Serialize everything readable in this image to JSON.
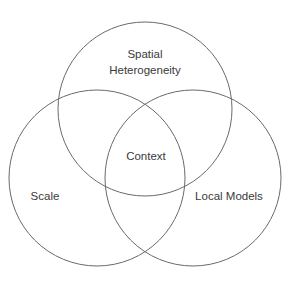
{
  "diagram": {
    "type": "venn",
    "stroke_color": "#6a6a6a",
    "text_color": "#3a3a3a",
    "sets": [
      {
        "id": "spatial-heterogeneity",
        "label_lines": [
          "Spatial",
          "Heterogeneity"
        ]
      },
      {
        "id": "scale",
        "label_lines": [
          "Scale"
        ]
      },
      {
        "id": "local-models",
        "label_lines": [
          "Local Models"
        ]
      }
    ],
    "intersection": {
      "label": "Context"
    }
  }
}
